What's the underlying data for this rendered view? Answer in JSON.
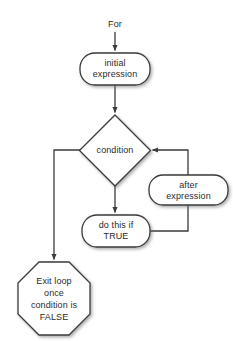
{
  "diagram": {
    "background_color": "#ffffff",
    "stroke_color": "#3a3a3a",
    "text_color": "#2b2b2b",
    "shape_fill": "#ffffff",
    "nodes": {
      "entry_label": "For",
      "initial": "initial\nexpression",
      "condition": "condition",
      "after": "after\nexpression",
      "body": "do this if\nTRUE",
      "exit": "Exit loop\nonce\ncondition is\nFALSE"
    },
    "shapes": {
      "entry_label": "text",
      "initial": "rounded-rectangle",
      "condition": "diamond",
      "after": "rounded-rectangle",
      "body": "rounded-rectangle",
      "exit": "octagon"
    },
    "edges": [
      {
        "from": "entry_label",
        "to": "initial",
        "arrow": true
      },
      {
        "from": "initial",
        "to": "condition",
        "arrow": true
      },
      {
        "from": "condition",
        "to": "exit",
        "arrow": true
      },
      {
        "from": "condition",
        "to": "body",
        "arrow": true
      },
      {
        "from": "body",
        "to": "after",
        "arrow": false
      },
      {
        "from": "after",
        "to": "condition",
        "arrow": true
      }
    ]
  }
}
